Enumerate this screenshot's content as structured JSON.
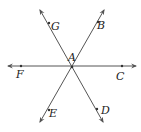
{
  "diagram": {
    "type": "intersecting-lines",
    "center_point": {
      "label": "A",
      "x": 72,
      "y": 67
    },
    "lines": [
      {
        "name": "line-FC",
        "from": {
          "x": 8,
          "y": 66
        },
        "to": {
          "x": 136,
          "y": 66
        },
        "points": [
          "F",
          "C"
        ]
      },
      {
        "name": "line-GD",
        "from": {
          "x": 40,
          "y": 10
        },
        "to": {
          "x": 103,
          "y": 122
        },
        "points": [
          "G",
          "D"
        ]
      },
      {
        "name": "line-BE",
        "from": {
          "x": 104,
          "y": 10
        },
        "to": {
          "x": 40,
          "y": 122
        },
        "points": [
          "B",
          "E"
        ]
      }
    ],
    "points": [
      {
        "label": "A",
        "x": 72,
        "y": 67,
        "label_x": 69,
        "label_y": 61
      },
      {
        "label": "B",
        "x": 98,
        "y": 22,
        "label_x": 98,
        "label_y": 28
      },
      {
        "label": "C",
        "x": 122,
        "y": 66,
        "label_x": 117,
        "label_y": 80
      },
      {
        "label": "D",
        "x": 97,
        "y": 109,
        "label_x": 101,
        "label_y": 113
      },
      {
        "label": "E",
        "x": 49,
        "y": 110,
        "label_x": 49,
        "label_y": 116
      },
      {
        "label": "F",
        "x": 21,
        "y": 66,
        "label_x": 16,
        "label_y": 78
      },
      {
        "label": "G",
        "x": 49,
        "y": 23,
        "label_x": 51,
        "label_y": 29
      }
    ],
    "line_color": "#555555",
    "label_color": "#222222"
  }
}
